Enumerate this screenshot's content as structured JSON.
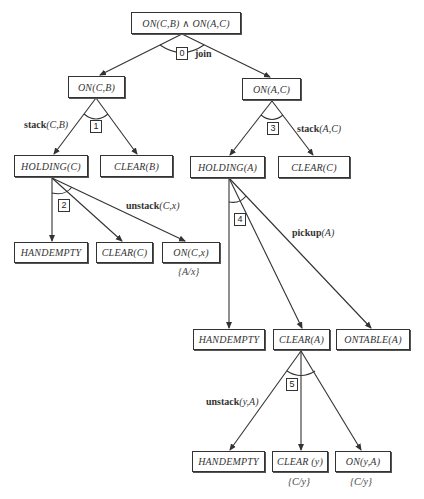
{
  "diagram": {
    "nodes": {
      "root": "ON(C,B) ∧ ON(A,C)",
      "on_cb": "ON(C,B)",
      "on_ac": "ON(A,C)",
      "holding_c": "HOLDING(C)",
      "clear_b": "CLEAR(B)",
      "holding_a": "HOLDING(A)",
      "clear_c_top": "CLEAR(C)",
      "handempty_1": "HANDEMPTY",
      "clear_c": "CLEAR(C)",
      "on_cx": "ON(C,x)",
      "handempty_2": "HANDEMPTY",
      "clear_a": "CLEAR(A)",
      "ontable_a": "ONTABLE(A)",
      "handempty_3": "HANDEMPTY",
      "clear_y": "CLEAR (y)",
      "on_ya": "ON(y,A)"
    },
    "substitutions": {
      "on_cx": "{A/x}",
      "clear_y": "{C/y}",
      "on_ya": "{C/y}"
    },
    "and_arcs": [
      {
        "number": "0",
        "operator_name": "join",
        "operator_args": ""
      },
      {
        "number": "1",
        "operator_name": "stack",
        "operator_args": "(C,B)"
      },
      {
        "number": "2",
        "operator_name": "unstack",
        "operator_args": "(C,x)"
      },
      {
        "number": "3",
        "operator_name": "stack",
        "operator_args": "(A,C)"
      },
      {
        "number": "4",
        "operator_name": "pickup",
        "operator_args": "(A)"
      },
      {
        "number": "5",
        "operator_name": "unstack",
        "operator_args": "(y,A)"
      }
    ],
    "colors": {
      "line": "#333333",
      "background": "#ffffff"
    }
  }
}
